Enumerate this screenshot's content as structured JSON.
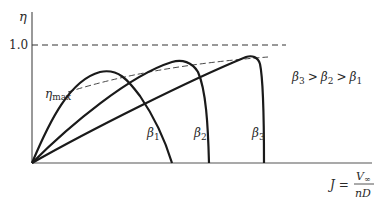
{
  "diagram": {
    "y_axis": {
      "symbol": "η",
      "tick_label": "1.0"
    },
    "x_axis": {
      "label_lhs": "J =",
      "numerator": "V∞",
      "numerator_base": "V",
      "numerator_sub": "∞",
      "denominator": "nD"
    },
    "envelope_label": {
      "base": "η",
      "sub": "max"
    },
    "relation": {
      "text": "β3 > β2 > β1",
      "b3": "β",
      "b3_sub": "3",
      "gt1": ">",
      "b2": "β",
      "b2_sub": "2",
      "gt2": ">",
      "b1": "β",
      "b1_sub": "1"
    },
    "curves": [
      {
        "name": "beta-1",
        "label": "β",
        "sub": "1"
      },
      {
        "name": "beta-2",
        "label": "β",
        "sub": "2"
      },
      {
        "name": "beta-3",
        "label": "β",
        "sub": "3"
      }
    ],
    "colors": {
      "line": "#1a1a1a",
      "axis": "#555555",
      "dash": "#333333",
      "text": "#2a2a2a"
    }
  }
}
